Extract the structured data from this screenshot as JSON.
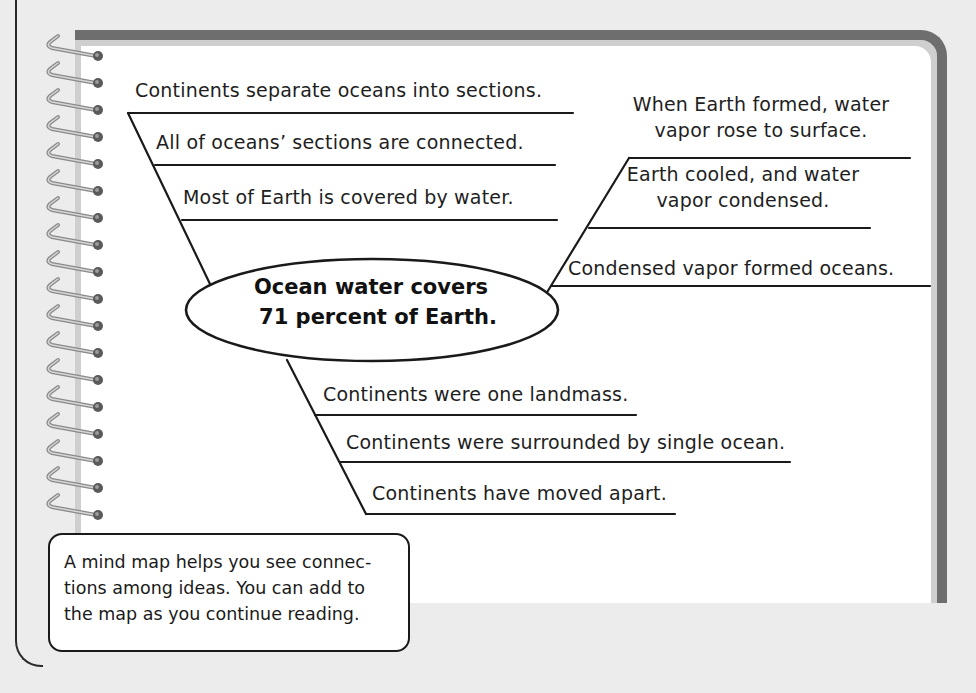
{
  "center_node": {
    "lines": [
      "Ocean water covers",
      "71 percent of Earth."
    ]
  },
  "branches": {
    "upper_left": [
      "Continents separate oceans into sections.",
      "All of oceans’ sections are connected.",
      "Most of Earth is covered by water."
    ],
    "upper_right": [
      [
        "When Earth formed, water",
        "vapor rose to surface."
      ],
      [
        "Earth cooled, and water",
        "vapor condensed."
      ],
      [
        "Condensed vapor formed oceans."
      ]
    ],
    "lower": [
      "Continents were one landmass.",
      "Continents were surrounded by single ocean.",
      "Continents have moved apart."
    ]
  },
  "callout": {
    "lines": [
      "A mind map helps you see connec-",
      "tions among ideas. You can add to",
      "the map as you continue reading."
    ]
  },
  "colors": {
    "frame": "#6e6e6e",
    "page": "#ffffff",
    "background": "#ececec",
    "ink": "#1e1e1e"
  }
}
